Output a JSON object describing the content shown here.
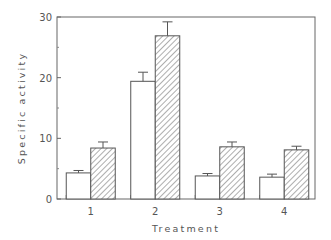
{
  "chart_data": {
    "type": "bar",
    "title": "",
    "xlabel": "Treatment",
    "ylabel": "Specific activity",
    "categories": [
      "1",
      "2",
      "3",
      "4"
    ],
    "ylim": [
      0,
      30
    ],
    "yticks": [
      "0",
      "10",
      "20",
      "30"
    ],
    "minor_yticks": [
      5,
      15,
      25
    ],
    "grid": false,
    "legend": null,
    "series": [
      {
        "name": "open",
        "pattern": "white",
        "values": [
          4.3,
          19.4,
          3.8,
          3.6
        ],
        "errors": [
          0.4,
          1.5,
          0.4,
          0.5
        ]
      },
      {
        "name": "hatched",
        "pattern": "diagonal-hatch",
        "values": [
          8.4,
          26.9,
          8.6,
          8.1
        ],
        "errors": [
          1.0,
          2.3,
          0.8,
          0.6
        ]
      }
    ]
  }
}
